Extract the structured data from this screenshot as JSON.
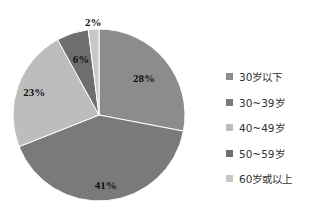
{
  "chart_data": {
    "type": "pie",
    "title": "",
    "start_angle": "12 o'clock, clockwise",
    "legend_position": "right",
    "slices": [
      {
        "label": "30岁以下",
        "value": 28,
        "display": "28%",
        "color": "#8c8c8c"
      },
      {
        "label": "30~39岁",
        "value": 41,
        "display": "41%",
        "color": "#7a7a7a"
      },
      {
        "label": "40~49岁",
        "value": 23,
        "display": "23%",
        "color": "#bdbdbd"
      },
      {
        "label": "50~59岁",
        "value": 6,
        "display": "6%",
        "color": "#6e6e6e"
      },
      {
        "label": "60岁或以上",
        "value": 2,
        "display": "2%",
        "color": "#c8c8c8"
      }
    ]
  },
  "legend": {
    "items": [
      "30岁以下",
      "30~39岁",
      "40~49岁",
      "50~59岁",
      "60岁或以上"
    ]
  }
}
